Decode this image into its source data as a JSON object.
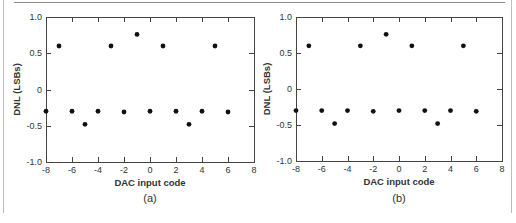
{
  "chart_data": [
    {
      "type": "scatter",
      "panel_label": "(a)",
      "xlabel": "DAC input code",
      "ylabel": "DNL (LSBs)",
      "xlim": [
        -8,
        8
      ],
      "ylim": [
        -1.0,
        1.0
      ],
      "xticks": [
        -8,
        -6,
        -4,
        -2,
        0,
        2,
        4,
        6,
        8
      ],
      "xtick_labels": [
        "-8",
        "-6",
        "-4",
        "-2",
        "0",
        "2",
        "4",
        "6",
        "8"
      ],
      "yticks": [
        1.0,
        0.5,
        0,
        -0.5,
        -1.0
      ],
      "ytick_labels": [
        "1.0",
        "0.5",
        "0",
        "-0.5",
        "-1.0"
      ],
      "grid": false,
      "legend": null,
      "x": [
        -8,
        -7,
        -6,
        -5,
        -4,
        -3,
        -2,
        -1,
        0,
        1,
        2,
        3,
        4,
        5,
        6
      ],
      "y": [
        -0.3,
        0.6,
        -0.3,
        -0.48,
        -0.3,
        0.6,
        -0.31,
        0.76,
        -0.3,
        0.6,
        -0.3,
        -0.48,
        -0.3,
        0.6,
        -0.31
      ]
    },
    {
      "type": "scatter",
      "panel_label": "(b)",
      "xlabel": "DAC input code",
      "ylabel": "DNL (LSBs)",
      "xlim": [
        -8,
        8
      ],
      "ylim": [
        -1.0,
        1.0
      ],
      "xticks": [
        -8,
        -6,
        -4,
        -2,
        0,
        2,
        4,
        6,
        8
      ],
      "xtick_labels": [
        "-8",
        "-6",
        "-4",
        "-2",
        "0",
        "2",
        "4",
        "6",
        "8"
      ],
      "yticks": [
        1.0,
        0.5,
        0,
        -0.5,
        -1.0
      ],
      "ytick_labels": [
        "1.0",
        "0.5",
        "0",
        "-0.5",
        "-1.0"
      ],
      "grid": false,
      "legend": null,
      "x": [
        -8,
        -7,
        -6,
        -5,
        -4,
        -3,
        -2,
        -1,
        0,
        1,
        2,
        3,
        4,
        5,
        6
      ],
      "y": [
        -0.3,
        0.6,
        -0.3,
        -0.48,
        -0.3,
        0.6,
        -0.31,
        0.76,
        -0.3,
        0.6,
        -0.3,
        -0.48,
        -0.3,
        0.6,
        -0.31
      ]
    }
  ],
  "colors": {
    "marker": "#111111",
    "axis": "#444444",
    "text": "#333333",
    "rule": "#8a8a8a"
  }
}
